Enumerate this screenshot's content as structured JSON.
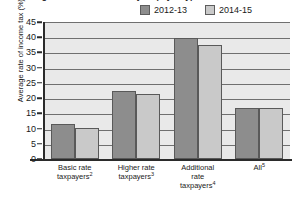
{
  "chart_data": {
    "type": "bar",
    "title": "Average rate of income tax by taxpayer type",
    "xlabel": "",
    "ylabel": "Average rate of income tax (%)",
    "ylim": [
      0,
      45
    ],
    "ytick_step": 5,
    "yticks": [
      "45",
      "40",
      "35",
      "30",
      "25",
      "20",
      "15",
      "10",
      "5",
      "0"
    ],
    "grid": true,
    "legend_position": "top-right",
    "categories": [
      "Basic rate taxpayers",
      "Higher rate taxpayers",
      "Additional rate taxpayers",
      "All"
    ],
    "category_footnotes": [
      "2",
      "3",
      "4",
      "5"
    ],
    "category_lines": [
      [
        "Basic rate",
        "taxpayers"
      ],
      [
        "Higher rate",
        "taxpayers"
      ],
      [
        "Additional",
        "rate",
        "taxpayers"
      ],
      [
        "All"
      ]
    ],
    "series": [
      {
        "name": "2012-13",
        "color": "#8d8d8d",
        "values": [
          11.5,
          22.4,
          39.7,
          16.6
        ]
      },
      {
        "name": "2014-15",
        "color": "#c9c9c9",
        "values": [
          10.2,
          21.4,
          37.6,
          16.6
        ]
      }
    ]
  },
  "colors": {
    "series_2012_13": "#8d8d8d",
    "series_2014_15": "#c9c9c9",
    "plot_background": "#e9e9e9",
    "gridline": "#6f6f6f",
    "axis": "#2b2b2b"
  }
}
